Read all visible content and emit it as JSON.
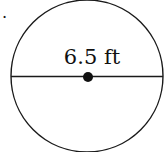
{
  "diagram": {
    "problem_marker": ".",
    "shape": "circle",
    "segment": "diameter",
    "measurement_label": "6.5 ft",
    "colors": {
      "stroke": "#1a1a1a",
      "fill": "#ffffff",
      "text": "#111111"
    }
  }
}
